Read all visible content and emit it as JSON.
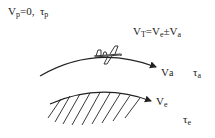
{
  "diagram": {
    "top_label": {
      "v_main": "V",
      "v_sub": "p",
      "v_value": "=0,",
      "tau_main": "τ",
      "tau_sub": "p"
    },
    "formula": {
      "v1_main": "V",
      "v1_sub": "T",
      "eq": "=V",
      "v2_sub": "e",
      "pm": "±V",
      "v3_sub": "a"
    },
    "upper_curve": {
      "name": "aircraft trajectory",
      "label_main": "V",
      "label_sub": "a",
      "tau_main": "τ",
      "tau_sub": "a"
    },
    "lower_curve": {
      "name": "earth surface",
      "label_main": "V",
      "label_sub": "e",
      "tau_main": "τ",
      "tau_sub": "e"
    },
    "colors": {
      "stroke": "#222222",
      "text": "#1a1a1a",
      "background": "#ffffff"
    }
  }
}
